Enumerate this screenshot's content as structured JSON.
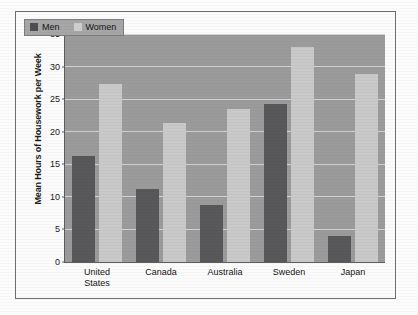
{
  "chart_data": {
    "type": "bar",
    "title": "",
    "xlabel": "",
    "ylabel": "Mean Hours of Housework per Week",
    "ylim": [
      0,
      35
    ],
    "yticks": [
      0,
      5,
      10,
      15,
      20,
      25,
      30,
      35
    ],
    "ytick_labels": [
      "0",
      "5",
      "10",
      "15",
      "20",
      "25",
      "30",
      "35"
    ],
    "grid": true,
    "legend_position": "top-left",
    "categories": [
      "United\nStates",
      "Canada",
      "Australia",
      "Sweden",
      "Japan"
    ],
    "series": [
      {
        "name": "Men",
        "color": "#58585a",
        "values": [
          16.2,
          11.2,
          8.8,
          24.2,
          4.0
        ]
      },
      {
        "name": "Women",
        "color": "#c9c9c9",
        "values": [
          27.3,
          21.3,
          23.5,
          33.0,
          28.8
        ]
      }
    ]
  },
  "legend": {
    "entries": [
      {
        "label": "Men"
      },
      {
        "label": "Women"
      }
    ]
  },
  "colors": {
    "men_bar": "#58585a",
    "women_bar": "#c9c9c9",
    "plot_background": "#9b9b9b",
    "gridline": "#d2d2d2",
    "axis": "#5d5d5d",
    "frame": "#6f6f6f",
    "page": "#fcfcfc"
  }
}
